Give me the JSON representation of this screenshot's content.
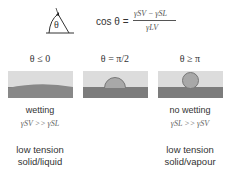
{
  "equation": {
    "lhs": "cos θ =",
    "numerator": "γSV − γSL",
    "denominator": "γLV"
  },
  "angle_icon": {
    "symbol": "θ"
  },
  "cases": [
    {
      "title": "θ ≤ 0",
      "label": "wetting",
      "relation": "γSV >> γSL",
      "desc_line1": "low tension",
      "desc_line2": "solid/liquid"
    },
    {
      "title": "θ = π/2",
      "label": "",
      "relation": "",
      "desc_line1": "",
      "desc_line2": ""
    },
    {
      "title": "θ ≥ π",
      "label": "no wetting",
      "relation": "γSL >> γSV",
      "desc_line1": "low tension",
      "desc_line2": "solid/vapour"
    }
  ],
  "colors": {
    "panel_bg": "#dcdcdc",
    "substrate": "#7c7c7c",
    "droplet": "#a8a8a8"
  }
}
